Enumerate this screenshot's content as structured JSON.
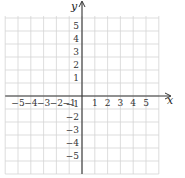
{
  "chart_data": {
    "type": "scatter",
    "title": "",
    "xlabel": "x",
    "ylabel": "y",
    "xlim": [
      -6,
      6
    ],
    "ylim": [
      -6,
      6
    ],
    "grid": true,
    "x_ticks": [
      -5,
      -4,
      -3,
      -2,
      -1,
      1,
      2,
      3,
      4,
      5
    ],
    "y_ticks": [
      5,
      4,
      3,
      2,
      1,
      -1,
      -2,
      -3,
      -4,
      -5
    ],
    "x_tick_labels": [
      "−5",
      "−4",
      "−3",
      "−2",
      "−1",
      "1",
      "2",
      "3",
      "4",
      "5"
    ],
    "y_tick_labels": [
      "5",
      "4",
      "3",
      "2",
      "1",
      "−1",
      "−2",
      "−3",
      "−4",
      "−5"
    ],
    "series": [],
    "legend": null
  },
  "colors": {
    "grid": "#d4d4d4",
    "axis": "#333333",
    "text": "#333333"
  },
  "layout": {
    "origin_x": 82,
    "origin_y": 96,
    "unit_x": 12.8,
    "unit_y": 13
  }
}
